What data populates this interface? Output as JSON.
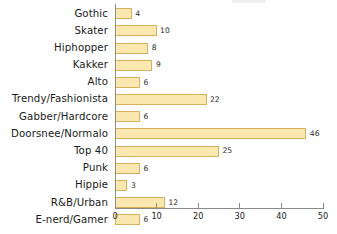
{
  "chart_data": {
    "type": "bar",
    "orientation": "horizontal",
    "title": "",
    "xlabel": "",
    "ylabel": "",
    "xlim": [
      0,
      50
    ],
    "xticks": [
      0,
      10,
      20,
      30,
      40,
      50
    ],
    "grid": false,
    "legend": null,
    "bar_color": "#fae8b0",
    "bar_border_color": "#d8b25a",
    "axis_color": "#8a8a8a",
    "categories": [
      "Gothic",
      "Skater",
      "Hiphopper",
      "Kakker",
      "Alto",
      "Trendy/Fashionista",
      "Gabber/Hardcore",
      "Doorsnee/Normalo",
      "Top 40",
      "Punk",
      "Hippie",
      "R&B/Urban",
      "E-nerd/Gamer"
    ],
    "values": [
      4,
      10,
      8,
      9,
      6,
      22,
      6,
      46,
      25,
      6,
      3,
      12,
      6
    ],
    "value_labels": [
      "4",
      "10",
      "8",
      "9",
      "6",
      "22",
      "6",
      "46",
      "25",
      "6",
      "3",
      "12",
      "6"
    ],
    "tick_labels": [
      "0",
      "10",
      "20",
      "30",
      "40",
      "50"
    ]
  }
}
